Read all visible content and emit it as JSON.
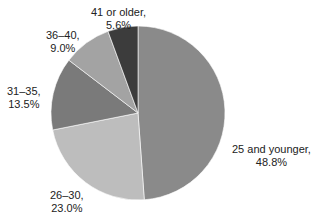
{
  "chart_data": {
    "type": "pie",
    "title": "",
    "categories": [
      "25  and younger",
      "26–30",
      "31–35",
      "36–40",
      "41 or older"
    ],
    "values": [
      48.8,
      23.0,
      13.5,
      9.0,
      5.6
    ],
    "labels": [
      {
        "name": "25  and younger,",
        "value": "48.8%"
      },
      {
        "name": "26–30,",
        "value": "23.0%"
      },
      {
        "name": "31–35,",
        "value": "13.5%"
      },
      {
        "name": "36–40,",
        "value": "9.0%"
      },
      {
        "name": "41 or older,",
        "value": "5.6%"
      }
    ],
    "colors": [
      "#8a8a8a",
      "#bdbdbd",
      "#7a7a7a",
      "#a3a3a3",
      "#3c3c3c"
    ],
    "start_angle_deg": 0,
    "direction": "clockwise",
    "legend": "none (direct labels)"
  }
}
